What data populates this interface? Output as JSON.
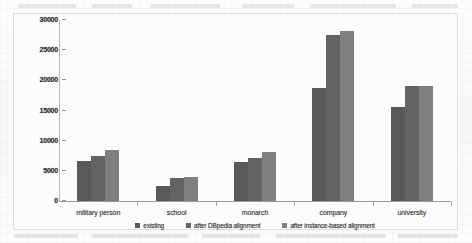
{
  "chart_data": {
    "type": "bar",
    "title": "",
    "subtitle": "",
    "xlabel": "",
    "ylabel": "",
    "categories": [
      "military person",
      "school",
      "monarch",
      "company",
      "university"
    ],
    "series": [
      {
        "name": "existing",
        "color": "#595959",
        "values": [
          6600,
          2500,
          6500,
          18800,
          15500
        ]
      },
      {
        "name": "after DBpedia alignment",
        "color": "#636363",
        "values": [
          7500,
          3800,
          7200,
          27500,
          19000
        ]
      },
      {
        "name": "after instance-based alignment",
        "color": "#7f7f7f",
        "values": [
          8400,
          4000,
          8200,
          28200,
          19000
        ]
      }
    ],
    "ylim": [
      0,
      30000
    ],
    "ytick_values": [
      30000,
      25000,
      20000,
      15000,
      10000,
      5000,
      0
    ],
    "ytick_labels": [
      "30000",
      "25000",
      "20000",
      "15000",
      "10000",
      "5000",
      "0"
    ],
    "grid": false,
    "legend_position": "bottom",
    "legend_marker": "square"
  },
  "frame": {
    "border_color": "#dddddd",
    "background": "#fcfcfc"
  }
}
